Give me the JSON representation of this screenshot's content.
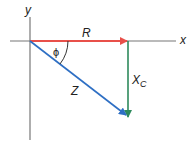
{
  "diagram": {
    "axes": {
      "x_label": "x",
      "y_label": "y"
    },
    "vectors": [
      {
        "name": "R",
        "label": "R",
        "color": "#e8504a",
        "direction": "positive x"
      },
      {
        "name": "X_C",
        "label": "X",
        "subscript": "C",
        "color": "#2e8a5c",
        "direction": "negative y"
      },
      {
        "name": "Z",
        "label": "Z",
        "color": "#2e6fc4",
        "direction": "resultant"
      }
    ],
    "angle": {
      "label": "ϕ"
    },
    "colors": {
      "axis": "#777777",
      "text": "#222222"
    }
  }
}
